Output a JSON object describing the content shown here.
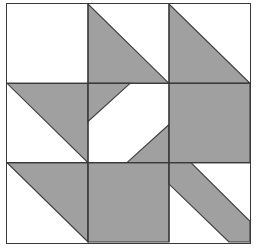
{
  "artwork": {
    "title": "Quilt Block Pattern",
    "kind": "nine-patch-quilt-block",
    "canvas": {
      "width": 258,
      "height": 250,
      "background": "#ffffff"
    },
    "frame": {
      "x": 6,
      "y": 3,
      "width": 245,
      "height": 241,
      "stroke": "#3a3a3a",
      "stroke_width": 1,
      "fill": "#ffffff"
    },
    "palette": {
      "light": "#ffffff",
      "dark": "#a0a0a0",
      "outline": "#3a3a3a",
      "page_background": "#ffffff"
    },
    "grid": {
      "rows": 3,
      "columns": 3,
      "cell_width": 81.333,
      "cell_height": 79.667,
      "x_lines": [
        0,
        81.333,
        162.667,
        244
      ],
      "y_lines": [
        0,
        79.667,
        159.333,
        240
      ]
    },
    "cells": [
      {
        "id": "cell-r1c1",
        "row": 1,
        "column": 1,
        "label": "plain light square",
        "pattern": "solid-light",
        "shapes": []
      },
      {
        "id": "cell-r1c2",
        "row": 1,
        "column": 2,
        "label": "half-square triangle, dark lower-left",
        "pattern": "half-square-triangle",
        "dark_corner": "lower-left",
        "shapes": [
          {
            "type": "polygon",
            "fill": "dark",
            "points": "0,0 0,1 1,1"
          }
        ]
      },
      {
        "id": "cell-r1c3",
        "row": 1,
        "column": 3,
        "label": "half-square triangle, dark lower-left",
        "pattern": "half-square-triangle",
        "dark_corner": "lower-left",
        "shapes": [
          {
            "type": "polygon",
            "fill": "dark",
            "points": "0,0 0,1 1,1"
          }
        ]
      },
      {
        "id": "cell-r2c1",
        "row": 2,
        "column": 1,
        "label": "half-square triangle, dark upper-right",
        "pattern": "half-square-triangle",
        "dark_corner": "upper-right",
        "shapes": [
          {
            "type": "polygon",
            "fill": "dark",
            "points": "0,0 1,0 1,1"
          }
        ]
      },
      {
        "id": "cell-r2c2",
        "row": 2,
        "column": 2,
        "label": "center bowtie, dark notches at upper-left and lower-right",
        "pattern": "bowtie-notch",
        "shapes": [
          {
            "type": "polygon",
            "fill": "dark",
            "points": "0,0 0.52,0 0,0.48"
          },
          {
            "type": "polygon",
            "fill": "dark",
            "points": "1,1 0.48,1 1,0.52"
          }
        ]
      },
      {
        "id": "cell-r2c3",
        "row": 2,
        "column": 3,
        "label": "solid dark square",
        "pattern": "solid-dark",
        "shapes": [
          {
            "type": "polygon",
            "fill": "dark",
            "points": "0,0 1,0 1,1 0,1"
          }
        ]
      },
      {
        "id": "cell-r3c1",
        "row": 3,
        "column": 1,
        "label": "half-square triangle, dark upper-right",
        "pattern": "half-square-triangle",
        "dark_corner": "upper-right",
        "shapes": [
          {
            "type": "polygon",
            "fill": "dark",
            "points": "0,0 1,0 1,1"
          }
        ]
      },
      {
        "id": "cell-r3c2",
        "row": 3,
        "column": 2,
        "label": "solid dark square",
        "pattern": "solid-dark",
        "shapes": [
          {
            "type": "polygon",
            "fill": "dark",
            "points": "0,0 1,0 1,1 0,1"
          }
        ]
      },
      {
        "id": "cell-r3c3",
        "row": 3,
        "column": 3,
        "label": "diagonal dark band, upper-left to lower-right",
        "pattern": "diagonal-band",
        "shapes": [
          {
            "type": "polygon",
            "fill": "dark",
            "points": "0,0 0.27,0 1,0.74 1,1 0.74,1 0,0.27"
          }
        ]
      }
    ],
    "grid_lines": [
      {
        "id": "vline-1",
        "orientation": "vertical",
        "position": 81.333
      },
      {
        "id": "vline-2",
        "orientation": "vertical",
        "position": 162.667
      },
      {
        "id": "hline-1",
        "orientation": "horizontal",
        "position": 79.667
      },
      {
        "id": "hline-2",
        "orientation": "horizontal",
        "position": 159.333
      }
    ]
  }
}
